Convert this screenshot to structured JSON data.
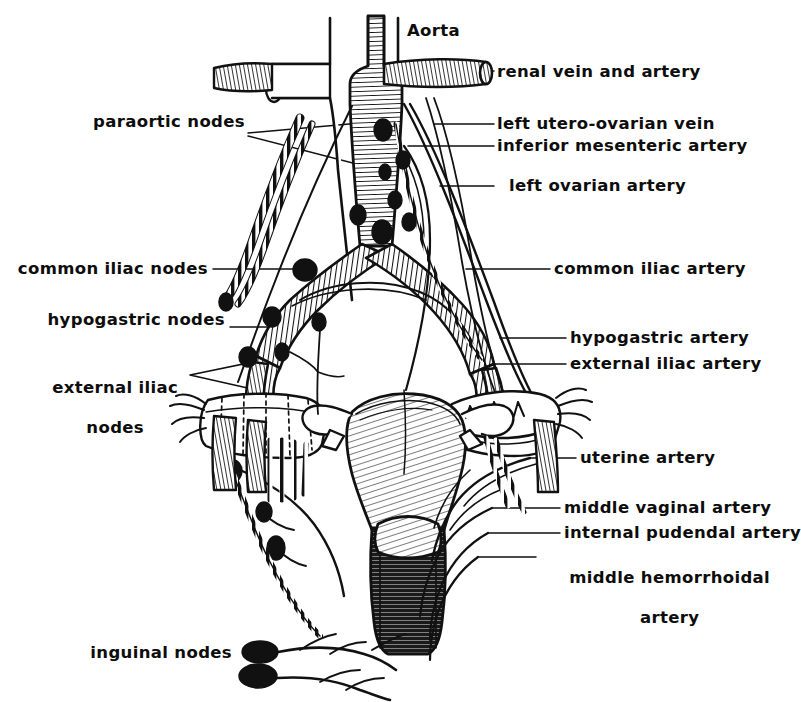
{
  "figure": {
    "style": "black-and-white line engraving",
    "background_color": "#ffffff",
    "ink_color": "#0d0d0d",
    "width": 775,
    "height": 702
  },
  "labels": {
    "aorta": "Aorta",
    "renal_vein_and_artery": "renal vein and artery",
    "left_utero_ovarian_vein": "left utero-ovarian vein",
    "inferior_mesenteric_artery": "inferior mesenteric artery",
    "left_ovarian_artery": "left ovarian artery",
    "paraortic_nodes": "paraortic nodes",
    "common_iliac_nodes": "common iliac nodes",
    "common_iliac_artery": "common iliac artery",
    "hypogastric_nodes": "hypogastric nodes",
    "hypogastric_artery": "hypogastric artery",
    "external_iliac_artery": "external iliac artery",
    "external_iliac_nodes_line1": "external iliac",
    "external_iliac_nodes_line2": "nodes",
    "uterine_artery": "uterine artery",
    "middle_vaginal_artery": "middle vaginal artery",
    "internal_pudendal_artery": "internal pudendal artery",
    "middle_hemorrhoidal_artery_line1": "middle hemorrhoidal",
    "middle_hemorrhoidal_artery_line2": "artery",
    "inguinal_nodes": "inguinal nodes"
  }
}
